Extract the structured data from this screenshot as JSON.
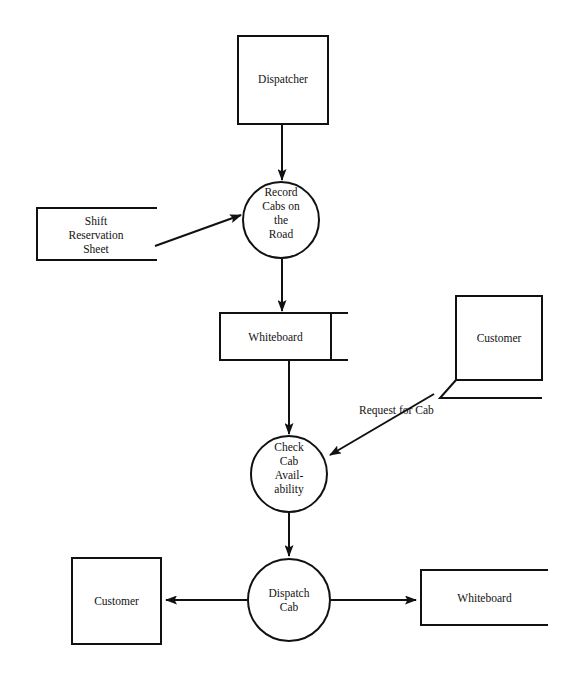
{
  "diagram": {
    "type": "data-flow-diagram",
    "nodes": [
      {
        "id": "dispatcher",
        "kind": "external-entity",
        "label": "Dispatcher",
        "shape": "rectangle"
      },
      {
        "id": "record-cabs",
        "kind": "process",
        "label": "Record\nCabs on\nthe\nRoad",
        "shape": "circle"
      },
      {
        "id": "shift-reservation-sheet",
        "kind": "data-store",
        "label": "Shift\nReservation\nSheet",
        "shape": "open-rectangle"
      },
      {
        "id": "whiteboard-top",
        "kind": "data-store",
        "label": "Whiteboard",
        "shape": "open-rectangle"
      },
      {
        "id": "customer-top",
        "kind": "external-entity",
        "label": "Customer",
        "shape": "rectangle"
      },
      {
        "id": "check-availability",
        "kind": "process",
        "label": "Check\nCab\nAvail-\nability",
        "shape": "circle"
      },
      {
        "id": "dispatch-cab",
        "kind": "process",
        "label": "Dispatch\nCab",
        "shape": "circle"
      },
      {
        "id": "customer-bottom",
        "kind": "external-entity",
        "label": "Customer",
        "shape": "rectangle"
      },
      {
        "id": "whiteboard-bottom",
        "kind": "data-store",
        "label": "Whiteboard",
        "shape": "open-rectangle"
      }
    ],
    "flows": [
      {
        "id": "f1",
        "from": "dispatcher",
        "to": "record-cabs",
        "label": ""
      },
      {
        "id": "f2",
        "from": "shift-reservation-sheet",
        "to": "record-cabs",
        "label": ""
      },
      {
        "id": "f3",
        "from": "record-cabs",
        "to": "whiteboard-top",
        "label": ""
      },
      {
        "id": "f4",
        "from": "whiteboard-top",
        "to": "check-availability",
        "label": ""
      },
      {
        "id": "f5",
        "from": "customer-top",
        "to": "check-availability",
        "label": "Request for Cab"
      },
      {
        "id": "f6",
        "from": "check-availability",
        "to": "dispatch-cab",
        "label": ""
      },
      {
        "id": "f7",
        "from": "dispatch-cab",
        "to": "customer-bottom",
        "label": ""
      },
      {
        "id": "f8",
        "from": "dispatch-cab",
        "to": "whiteboard-bottom",
        "label": ""
      }
    ],
    "colors": {
      "stroke": "#111111",
      "background": "#ffffff",
      "text": "#121212"
    }
  }
}
